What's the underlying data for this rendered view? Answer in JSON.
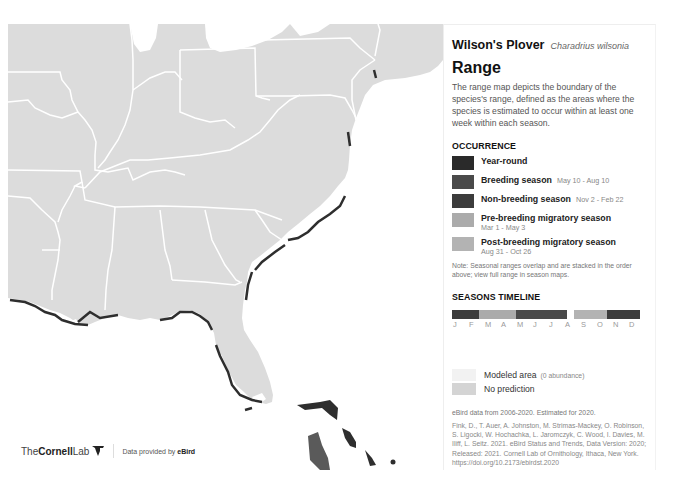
{
  "species": {
    "common_name": "Wilson's Plover",
    "scientific_name": "Charadrius wilsonia"
  },
  "range": {
    "heading": "Range",
    "description": "The range map depicts the boundary of the species's range, defined as the areas where the species is estimated to occur within at least one week within each season."
  },
  "occurrence": {
    "heading": "OCCURRENCE",
    "items": [
      {
        "label": "Year-round",
        "dates": "",
        "color": "#2a2a2a"
      },
      {
        "label": "Breeding season",
        "dates": "May 10 - Aug 10",
        "color": "#4a4a4a"
      },
      {
        "label": "Non-breeding season",
        "dates": "Nov 2 - Feb 22",
        "color": "#3c3c3c"
      },
      {
        "label": "Pre-breeding migratory season",
        "dates": "Mar 1 - May 3",
        "color": "#ababab"
      },
      {
        "label": "Post-breeding migratory season",
        "dates": "Aug 31 - Oct 26",
        "color": "#b3b3b3"
      }
    ],
    "note": "Note: Seasonal ranges overlap and are stacked in the order above; view full range in season maps."
  },
  "timeline": {
    "heading": "SEASONS TIMELINE",
    "months": [
      "J",
      "F",
      "M",
      "A",
      "M",
      "J",
      "J",
      "A",
      "S",
      "O",
      "N",
      "D"
    ],
    "segments": [
      {
        "name": "non-breeding",
        "start": 0,
        "end": 1.7,
        "color": "#3c3c3c"
      },
      {
        "name": "pre-breeding",
        "start": 1.7,
        "end": 4.1,
        "color": "#ababab"
      },
      {
        "name": "breeding",
        "start": 4.1,
        "end": 7.3,
        "color": "#4a4a4a"
      },
      {
        "name": "gap",
        "start": 7.3,
        "end": 8.0,
        "color": "#ffffff"
      },
      {
        "name": "post-breeding",
        "start": 8.0,
        "end": 10.1,
        "color": "#b3b3b3"
      },
      {
        "name": "non-breeding",
        "start": 10.1,
        "end": 12,
        "color": "#3c3c3c"
      }
    ]
  },
  "map_legend": {
    "modeled_label": "Modeled area",
    "modeled_sub": "(0 abundance)",
    "modeled_color": "#f2f2f2",
    "no_prediction_label": "No prediction",
    "no_prediction_color": "#d4d4d4"
  },
  "data_note": "eBird data from 2006-2020. Estimated for 2020.",
  "citation": "Fink, D., T. Auer, A. Johnston, M. Strimas-Mackey, O. Robinson, S. Ligocki, W. Hochachka, L. Jaromczyk, C. Wood, I. Davies, M. Iliff, L. Seitz. 2021. eBird Status and Trends, Data Version: 2020; Released: 2021. Cornell Lab of Ornithology, Ithaca, New York. https://doi.org/10.2173/ebirdst.2020",
  "footer": {
    "logo_the": "The",
    "logo_cornell": "Cornell",
    "logo_lab": "Lab",
    "provided_prefix": "Data provided by ",
    "provided_brand": "eBird"
  },
  "colors": {
    "land": "#dcdcdc",
    "border": "#ffffff",
    "range_dark": "#2e2e2e"
  }
}
